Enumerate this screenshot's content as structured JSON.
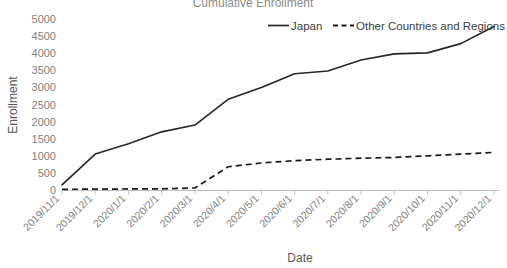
{
  "chart_data": {
    "type": "line",
    "title": "Cumulative Enrollment",
    "xlabel": "Date",
    "ylabel": "Enrollment",
    "ylim": [
      0,
      5000
    ],
    "ytick_labels": [
      "5000",
      "4500",
      "4000",
      "3500",
      "3000",
      "2500",
      "2000",
      "1500",
      "1000",
      "500",
      "0"
    ],
    "ytick_values": [
      5000,
      4500,
      4000,
      3500,
      3000,
      2500,
      2000,
      1500,
      1000,
      500,
      0
    ],
    "grid": false,
    "legend_position": "top-right",
    "categories": [
      "2019/11/1",
      "2019/12/1",
      "2020/1/1",
      "2020/2/1",
      "2020/3/1",
      "2020/4/1",
      "2020/5/1",
      "2020/6/1",
      "2020/7/1",
      "2020/8/1",
      "2020/9/1",
      "2020/10/1",
      "2020/11/1",
      "2020/12/1"
    ],
    "series": [
      {
        "name": "Japan",
        "style": "solid",
        "color": "#262626",
        "values": [
          150,
          1050,
          1350,
          1700,
          1900,
          2650,
          3000,
          3400,
          3480,
          3800,
          3980,
          4010,
          4280,
          4780
        ]
      },
      {
        "name": "Other Countries and Regions",
        "style": "dashed",
        "color": "#1a1a1a",
        "values": [
          20,
          25,
          30,
          35,
          60,
          680,
          790,
          860,
          900,
          930,
          950,
          1000,
          1050,
          1100
        ]
      }
    ]
  },
  "axes": {
    "y_title": "Enrollment",
    "x_title": "Date"
  },
  "legend": {
    "items": [
      {
        "label": "Japan"
      },
      {
        "label": "Other Countries and Regions"
      }
    ]
  }
}
